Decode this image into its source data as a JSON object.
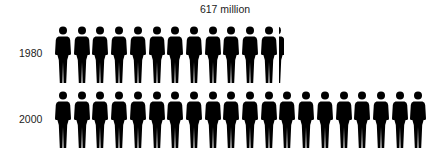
{
  "chart_data": {
    "type": "pictogram",
    "title": "617 million",
    "unit_per_icon": "approx. 50 million people",
    "categories": [
      "1980",
      "2000"
    ],
    "icon_counts": [
      12.1,
      20
    ],
    "values_millions": [
      617,
      1000
    ],
    "annotations": [
      "617 million"
    ],
    "icon": "person-icon",
    "color": "#000000"
  },
  "labels": {
    "title": "617 million",
    "row1": "1980",
    "row2": "2000"
  }
}
